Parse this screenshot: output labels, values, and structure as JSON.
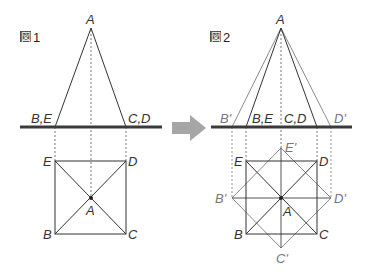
{
  "colors": {
    "line_dark": "#333333",
    "line_gray": "#8a8a8a",
    "ground": "#3a3a3a",
    "arrow": "#a6a6a6",
    "dotted": "#555555"
  },
  "figure1": {
    "title_glyph": "図",
    "title_num": "1",
    "labels": {
      "apex": "A",
      "left_base": "B,E",
      "right_base": "C,D",
      "sq_tl": "E",
      "sq_tr": "D",
      "sq_bl": "B",
      "sq_br": "C",
      "center": "A"
    }
  },
  "figure2": {
    "title_glyph": "図",
    "title_num": "2",
    "labels": {
      "apex": "A",
      "b_prime_top": "B'",
      "left_base": "B,E",
      "right_base": "C,D",
      "d_prime_top": "D'",
      "e_prime": "E'",
      "sq_tl": "E",
      "sq_tr": "D",
      "b_prime": "B'",
      "d_prime": "D'",
      "center": "A",
      "sq_bl": "B",
      "sq_br": "C",
      "c_prime": "C'"
    }
  }
}
